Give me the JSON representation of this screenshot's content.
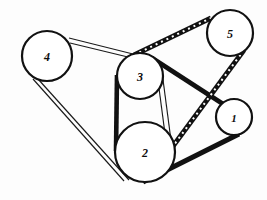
{
  "figure": {
    "kind": "pulley-belt-diagram",
    "background_color": "#fdfdfd",
    "line_color": "#111111",
    "width": 267,
    "height": 200
  },
  "pulleys": [
    {
      "id": "1",
      "label": "1",
      "cx": 234,
      "cy": 117,
      "r": 18,
      "label_size": 11
    },
    {
      "id": "2",
      "label": "2",
      "cx": 145,
      "cy": 152,
      "r": 30,
      "label_size": 12
    },
    {
      "id": "3",
      "label": "3",
      "cx": 140,
      "cy": 76,
      "r": 23,
      "label_size": 12
    },
    {
      "id": "4",
      "label": "4",
      "cx": 47,
      "cy": 56,
      "r": 25,
      "label_size": 12
    },
    {
      "id": "5",
      "label": "5",
      "cx": 230,
      "cy": 33,
      "r": 23,
      "label_size": 12
    }
  ],
  "belts": [
    {
      "id": "belt-4-3-upper",
      "style": "thin-double",
      "from": "4",
      "to": "3",
      "stroke_width": 1.15,
      "segments": [
        {
          "x1": 69,
          "y1": 38,
          "x2": 133,
          "y2": 54
        },
        {
          "x1": 70,
          "y1": 43,
          "x2": 132,
          "y2": 58
        }
      ]
    },
    {
      "id": "belt-4-2-lower",
      "style": "thin-double",
      "from": "4",
      "to": "2",
      "stroke_width": 1.15,
      "segments": [
        {
          "x1": 38,
          "y1": 79,
          "x2": 129,
          "y2": 180
        },
        {
          "x1": 33,
          "y1": 79,
          "x2": 124,
          "y2": 181
        }
      ]
    },
    {
      "id": "belt-3-2-left",
      "style": "thick",
      "from": "3",
      "to": "2",
      "stroke_width": 4.6,
      "segments": [
        {
          "x1": 117,
          "y1": 75,
          "x2": 116,
          "y2": 151
        }
      ]
    },
    {
      "id": "belt-3-2-right",
      "style": "thin-double",
      "from": "3",
      "to": "2",
      "stroke_width": 1.15,
      "segments": [
        {
          "x1": 162,
          "y1": 72,
          "x2": 172,
          "y2": 148
        },
        {
          "x1": 157,
          "y1": 73,
          "x2": 167,
          "y2": 149
        }
      ]
    },
    {
      "id": "belt-3-1-upper",
      "style": "thick",
      "from": "3",
      "to": "1",
      "stroke_width": 4.8,
      "segments": [
        {
          "x1": 152,
          "y1": 58,
          "x2": 223,
          "y2": 104
        }
      ]
    },
    {
      "id": "belt-1-2-lower",
      "style": "thick",
      "from": "1",
      "to": "2",
      "stroke_width": 5.2,
      "segments": [
        {
          "x1": 239,
          "y1": 134,
          "x2": 143,
          "y2": 182
        }
      ]
    },
    {
      "id": "belt-3-5-toothed",
      "style": "toothed",
      "from": "3",
      "to": "5",
      "stroke_width": 5.0,
      "tooth_dash": "2 4",
      "segments": [
        {
          "x1": 134,
          "y1": 55,
          "x2": 211,
          "y2": 18
        }
      ]
    },
    {
      "id": "belt-5-2-toothed",
      "style": "toothed",
      "from": "5",
      "to": "2",
      "stroke_width": 5.0,
      "tooth_dash": "2 4",
      "segments": [
        {
          "x1": 244,
          "y1": 50,
          "x2": 148,
          "y2": 180
        }
      ]
    }
  ],
  "caption": {
    "title": "",
    "note": ""
  }
}
